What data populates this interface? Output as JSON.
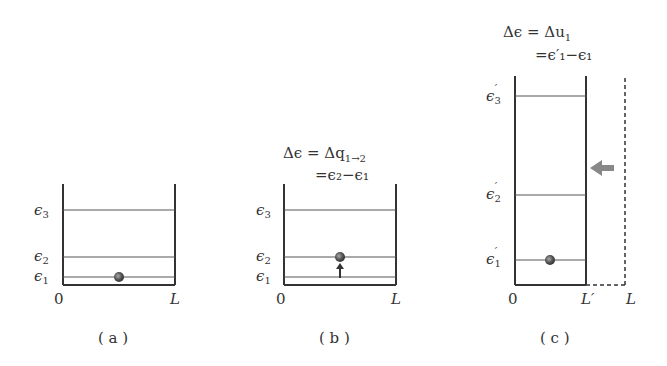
{
  "panels": [
    {
      "id": "a",
      "caption": "( a )",
      "levels": [
        {
          "symbol": "ϵ",
          "sub": "3",
          "prime": ""
        },
        {
          "symbol": "ϵ",
          "sub": "2",
          "prime": ""
        },
        {
          "symbol": "ϵ",
          "sub": "1",
          "prime": ""
        }
      ],
      "axis": {
        "origin": "0",
        "right": "L"
      },
      "particle_level": 1
    },
    {
      "id": "b",
      "caption": "( b )",
      "equation": {
        "line1": "Δϵ = Δq",
        "line1_sub": "1→2",
        "line2": "=ϵ₂−ϵ₁"
      },
      "levels": [
        {
          "symbol": "ϵ",
          "sub": "3",
          "prime": ""
        },
        {
          "symbol": "ϵ",
          "sub": "2",
          "prime": ""
        },
        {
          "symbol": "ϵ",
          "sub": "1",
          "prime": ""
        }
      ],
      "axis": {
        "origin": "0",
        "right": "L"
      },
      "particle_level": 2,
      "arrow": "up"
    },
    {
      "id": "c",
      "caption": "( c )",
      "equation": {
        "line1": "Δϵ = Δu",
        "line1_sub": "1",
        "line2": "=ϵ′₁−ϵ₁"
      },
      "levels": [
        {
          "symbol": "ϵ",
          "sub": "3",
          "prime": "′"
        },
        {
          "symbol": "ϵ",
          "sub": "2",
          "prime": "′"
        },
        {
          "symbol": "ϵ",
          "sub": "1",
          "prime": "′"
        }
      ],
      "axis": {
        "origin": "0",
        "right": "L′",
        "far_right": "L"
      },
      "particle_level": 1,
      "arrow": "left"
    }
  ],
  "colors": {
    "line": "#333333",
    "level": "#555555",
    "particle": "#555555",
    "arrow": "#888888"
  }
}
